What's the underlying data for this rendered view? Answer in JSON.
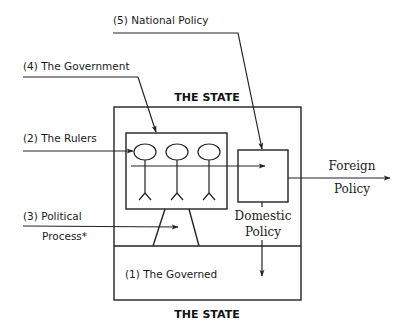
{
  "diagram": {
    "title_top": "THE STATE",
    "title_bottom": "THE STATE",
    "labels": {
      "national_policy": "(5)  National  Policy",
      "government": "(4)  The  Government",
      "rulers": "(2)  The  Rulers",
      "political_line1": "(3)  Political",
      "political_line2": "Process*",
      "governed": "(1)  The  Governed",
      "domestic_line1": "Domestic",
      "domestic_line2": "Policy",
      "foreign_line1": "Foreign",
      "foreign_line2": "Policy"
    },
    "elements": {
      "state_box": "outer state boundary",
      "government_box": "government box containing three rulers",
      "policy_box": "policy output box",
      "ruler_figures": [
        "ruler-1",
        "ruler-2",
        "ruler-3"
      ],
      "political_process_channel": "trapezoid linking governed to government"
    },
    "colors": {
      "line": "#222222",
      "text": "#1a1a1a",
      "background": "#ffffff"
    }
  }
}
